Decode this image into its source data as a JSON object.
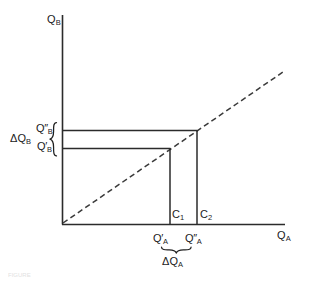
{
  "figure": {
    "type": "economics-indifference-diagram",
    "axes": {
      "y_label": "Q",
      "y_label_sub": "B",
      "x_label": "Q",
      "x_label_sub": "A",
      "y_axis_x": 62,
      "y_axis_top": 15,
      "x_axis_y": 224,
      "x_axis_right": 285,
      "origin_x": 62,
      "origin_y": 224
    },
    "reference_line": {
      "name": "45-degree-dashed-ray",
      "style": "dashed",
      "from_x": 62,
      "from_y": 224,
      "to_x": 283,
      "to_y": 72
    },
    "y_brace": {
      "glyph": "{",
      "label": "ΔQ",
      "label_sub": "B",
      "upper_value": "Q″",
      "upper_sub": "B",
      "lower_value": "Q′",
      "lower_sub": "B",
      "upper_y": 130,
      "lower_y": 148
    },
    "x_brace": {
      "glyph": "underbrace",
      "label": "ΔQ",
      "label_sub": "A",
      "left_value": "Q′",
      "left_sub": "A",
      "right_value": "Q″",
      "right_sub": "A",
      "left_x": 170,
      "right_x": 197
    },
    "points": [
      {
        "name": "C1",
        "label": "C",
        "label_sub": "1",
        "x": 170,
        "y": 148,
        "vertical_from_y": 148,
        "vertical_to_y": 224,
        "horizontal_from_x": 62
      },
      {
        "name": "C2",
        "label": "C",
        "label_sub": "2",
        "x": 197,
        "y": 130,
        "vertical_from_y": 130,
        "vertical_to_y": 224,
        "horizontal_from_x": 62
      }
    ],
    "colors": {
      "ink": "#1c1c1c",
      "line": "#2b2b2b",
      "dashed": "#3a3a3a",
      "background": "#ffffff"
    }
  },
  "caption": {
    "text": "FIGURE"
  }
}
